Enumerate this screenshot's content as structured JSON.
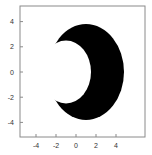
{
  "chart_data": {
    "type": "region",
    "title": "",
    "xlabel": "",
    "ylabel": "",
    "xlim": [
      -5.3,
      5.3
    ],
    "ylim": [
      -5.3,
      5.3
    ],
    "grid": false,
    "x_ticks": [
      -4,
      -2,
      0,
      2,
      4
    ],
    "y_ticks": [
      -4,
      -2,
      0,
      2,
      4
    ],
    "x_tick_labels": [
      "-4",
      "-2",
      "0",
      "2",
      "4"
    ],
    "y_tick_labels": [
      "4",
      "2",
      "0",
      "-2",
      "-4"
    ],
    "shapes": [
      {
        "name": "outer-disk",
        "center": [
          1.0,
          0.0
        ],
        "radius": 3.8,
        "fill": "#000000"
      },
      {
        "name": "inner-hole",
        "center": [
          -1.0,
          0.0
        ],
        "radius": 2.5,
        "fill": "#ffffff"
      }
    ]
  },
  "colors": {
    "region": "#000000",
    "background": "#ffffff",
    "frame": "#888888"
  }
}
